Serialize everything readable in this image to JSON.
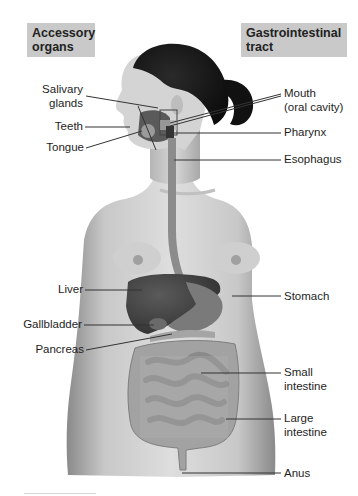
{
  "diagram": {
    "headers": {
      "left": "Accessory organs",
      "left_lines": [
        "Accessory",
        "organs"
      ],
      "right": "Gastrointestinal tract",
      "right_lines": [
        "Gastrointestinal",
        "tract"
      ]
    },
    "accessory_organs": [
      {
        "label": "Salivary glands",
        "lines": [
          "Salivary",
          "glands"
        ]
      },
      {
        "label": "Teeth",
        "lines": [
          "Teeth"
        ]
      },
      {
        "label": "Tongue",
        "lines": [
          "Tongue"
        ]
      },
      {
        "label": "Liver",
        "lines": [
          "Liver"
        ]
      },
      {
        "label": "Gallbladder",
        "lines": [
          "Gallbladder"
        ]
      },
      {
        "label": "Pancreas",
        "lines": [
          "Pancreas"
        ]
      }
    ],
    "gastrointestinal_tract": [
      {
        "label": "Mouth (oral cavity)",
        "lines": [
          "Mouth",
          "(oral cavity)"
        ]
      },
      {
        "label": "Pharynx",
        "lines": [
          "Pharynx"
        ]
      },
      {
        "label": "Esophagus",
        "lines": [
          "Esophagus"
        ]
      },
      {
        "label": "Stomach",
        "lines": [
          "Stomach"
        ]
      },
      {
        "label": "Small intestine",
        "lines": [
          "Small",
          "intestine"
        ]
      },
      {
        "label": "Large intestine",
        "lines": [
          "Large",
          "intestine"
        ]
      },
      {
        "label": "Anus",
        "lines": [
          "Anus"
        ]
      }
    ],
    "colors": {
      "header_bg": "#c9c9c9",
      "skin": "#d2d2d2",
      "hair": "#1a1a1a",
      "liver": "#4a4a4a",
      "intestine": "#9a9a9a",
      "leader_line": "#333333"
    }
  }
}
